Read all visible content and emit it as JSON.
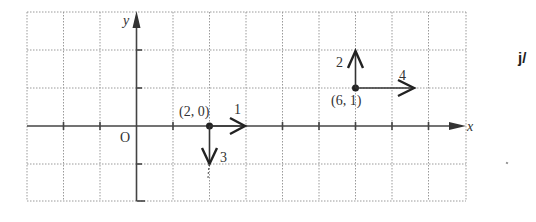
{
  "diagram": {
    "title": "",
    "axes": {
      "x_label": "x",
      "y_label": "y",
      "origin_label": "O",
      "x_range": [
        -3,
        9
      ],
      "y_range": [
        -2,
        3
      ]
    },
    "points": [
      {
        "label": "(2, 0)",
        "x": 2,
        "y": 0
      },
      {
        "label": "(6, 1)",
        "x": 6,
        "y": 1
      }
    ],
    "vectors": [
      {
        "from": [
          2,
          0
        ],
        "to": [
          3,
          0
        ],
        "label": "1",
        "direction": "right"
      },
      {
        "from": [
          2,
          0
        ],
        "to": [
          2,
          -1
        ],
        "label": "3",
        "direction": "down"
      },
      {
        "from": [
          6,
          1
        ],
        "to": [
          6,
          2
        ],
        "label": "2",
        "direction": "up"
      },
      {
        "from": [
          6,
          1
        ],
        "to": [
          8,
          1
        ],
        "label": "4",
        "direction": "right"
      }
    ],
    "side_text": "j/"
  }
}
